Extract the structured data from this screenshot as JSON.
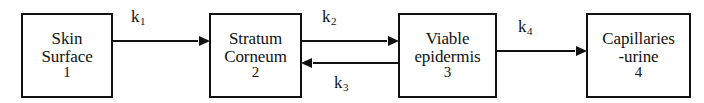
{
  "diagram": {
    "type": "flow-diagram",
    "stroke_color": "#111111",
    "background_color": "#ffffff",
    "compartments": [
      {
        "id": "skin-surface",
        "index": "1",
        "lines": [
          "Skin",
          "Surface"
        ]
      },
      {
        "id": "stratum-corneum",
        "index": "2",
        "lines": [
          "Stratum",
          "Corneum"
        ]
      },
      {
        "id": "viable-epidermis",
        "index": "3",
        "lines": [
          "Viable",
          "epidermis"
        ]
      },
      {
        "id": "capillaries-urine",
        "index": "4",
        "lines": [
          "Capillaries",
          "-urine"
        ]
      }
    ],
    "transfers": [
      {
        "id": "k1",
        "symbol": "k",
        "subscript": "1",
        "from": "skin-surface",
        "to": "stratum-corneum",
        "direction": "right",
        "label_position": "above"
      },
      {
        "id": "k2",
        "symbol": "k",
        "subscript": "2",
        "from": "stratum-corneum",
        "to": "viable-epidermis",
        "direction": "right",
        "label_position": "above"
      },
      {
        "id": "k3",
        "symbol": "k",
        "subscript": "3",
        "from": "viable-epidermis",
        "to": "stratum-corneum",
        "direction": "left",
        "label_position": "below"
      },
      {
        "id": "k4",
        "symbol": "k",
        "subscript": "4",
        "from": "viable-epidermis",
        "to": "capillaries-urine",
        "direction": "right",
        "label_position": "above"
      }
    ]
  }
}
